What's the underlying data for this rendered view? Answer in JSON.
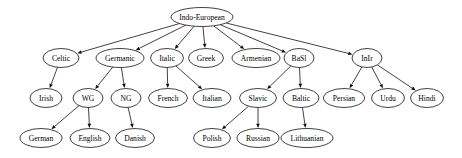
{
  "diagram": {
    "type": "directed-tree",
    "node_shape": "ellipse",
    "colors": {
      "background": "#ffffff",
      "node_fill": "#ffffff",
      "node_stroke": "#111111",
      "edge": "#111111",
      "label": "#000000"
    },
    "nodes": [
      {
        "id": "indo-european",
        "label": "Indo-European",
        "cx": 202,
        "cy": 17,
        "rx": 31,
        "ry": 9.5,
        "depth": 0
      },
      {
        "id": "celtic",
        "label": "Celtic",
        "cx": 61,
        "cy": 58,
        "rx": 18,
        "ry": 9.5,
        "depth": 1
      },
      {
        "id": "germanic",
        "label": "Germanic",
        "cx": 120,
        "cy": 58,
        "rx": 24,
        "ry": 9.5,
        "depth": 1
      },
      {
        "id": "italic",
        "label": "Italic",
        "cx": 167,
        "cy": 58,
        "rx": 16.5,
        "ry": 9.5,
        "depth": 1
      },
      {
        "id": "greek",
        "label": "Greek",
        "cx": 206,
        "cy": 58,
        "rx": 17.5,
        "ry": 9.5,
        "depth": 1
      },
      {
        "id": "armenian",
        "label": "Armenian",
        "cx": 256,
        "cy": 58,
        "rx": 24,
        "ry": 9.5,
        "depth": 1
      },
      {
        "id": "basl",
        "label": "BaSl",
        "cx": 299,
        "cy": 58,
        "rx": 15,
        "ry": 9.5,
        "depth": 1
      },
      {
        "id": "inir",
        "label": "InIr",
        "cx": 367,
        "cy": 58,
        "rx": 15,
        "ry": 9.5,
        "depth": 1
      },
      {
        "id": "irish",
        "label": "Irish",
        "cx": 46,
        "cy": 98,
        "rx": 16,
        "ry": 9.5,
        "depth": 2
      },
      {
        "id": "wg",
        "label": "WG",
        "cx": 88,
        "cy": 98,
        "rx": 15,
        "ry": 9.5,
        "depth": 2
      },
      {
        "id": "ng",
        "label": "NG",
        "cx": 126,
        "cy": 98,
        "rx": 15,
        "ry": 9.5,
        "depth": 2
      },
      {
        "id": "french",
        "label": "French",
        "cx": 168,
        "cy": 98,
        "rx": 19.5,
        "ry": 9.5,
        "depth": 2
      },
      {
        "id": "italian",
        "label": "Italian",
        "cx": 212,
        "cy": 98,
        "rx": 19,
        "ry": 9.5,
        "depth": 2
      },
      {
        "id": "slavic",
        "label": "Slavic",
        "cx": 258,
        "cy": 98,
        "rx": 18.5,
        "ry": 9.5,
        "depth": 2
      },
      {
        "id": "baltic",
        "label": "Baltic",
        "cx": 301,
        "cy": 98,
        "rx": 18,
        "ry": 9.5,
        "depth": 2
      },
      {
        "id": "persian",
        "label": "Persian",
        "cx": 344,
        "cy": 98,
        "rx": 20.5,
        "ry": 9.5,
        "depth": 2
      },
      {
        "id": "urdu",
        "label": "Urdu",
        "cx": 388,
        "cy": 98,
        "rx": 16.5,
        "ry": 9.5,
        "depth": 2
      },
      {
        "id": "hindi",
        "label": "Hindi",
        "cx": 427,
        "cy": 98,
        "rx": 16.5,
        "ry": 9.5,
        "depth": 2
      },
      {
        "id": "german",
        "label": "German",
        "cx": 41,
        "cy": 138,
        "rx": 21,
        "ry": 9.5,
        "depth": 3
      },
      {
        "id": "english",
        "label": "English",
        "cx": 90,
        "cy": 138,
        "rx": 20,
        "ry": 9.5,
        "depth": 3
      },
      {
        "id": "danish",
        "label": "Danish",
        "cx": 135,
        "cy": 138,
        "rx": 19.5,
        "ry": 9.5,
        "depth": 3
      },
      {
        "id": "polish",
        "label": "Polish",
        "cx": 212,
        "cy": 138,
        "rx": 18.5,
        "ry": 9.5,
        "depth": 3
      },
      {
        "id": "russian",
        "label": "Russian",
        "cx": 258,
        "cy": 138,
        "rx": 21,
        "ry": 9.5,
        "depth": 3
      },
      {
        "id": "lithuanian",
        "label": "Lithuanian",
        "cx": 307,
        "cy": 138,
        "rx": 26,
        "ry": 9.5,
        "depth": 3
      }
    ],
    "edges": [
      {
        "from": "indo-european",
        "to": "celtic"
      },
      {
        "from": "indo-european",
        "to": "germanic"
      },
      {
        "from": "indo-european",
        "to": "italic"
      },
      {
        "from": "indo-european",
        "to": "greek"
      },
      {
        "from": "indo-european",
        "to": "armenian"
      },
      {
        "from": "indo-european",
        "to": "basl"
      },
      {
        "from": "indo-european",
        "to": "inir"
      },
      {
        "from": "celtic",
        "to": "irish"
      },
      {
        "from": "germanic",
        "to": "wg"
      },
      {
        "from": "germanic",
        "to": "ng"
      },
      {
        "from": "italic",
        "to": "french"
      },
      {
        "from": "italic",
        "to": "italian"
      },
      {
        "from": "basl",
        "to": "slavic"
      },
      {
        "from": "basl",
        "to": "baltic"
      },
      {
        "from": "inir",
        "to": "persian"
      },
      {
        "from": "inir",
        "to": "urdu"
      },
      {
        "from": "inir",
        "to": "hindi"
      },
      {
        "from": "wg",
        "to": "german"
      },
      {
        "from": "wg",
        "to": "english"
      },
      {
        "from": "ng",
        "to": "danish"
      },
      {
        "from": "slavic",
        "to": "polish"
      },
      {
        "from": "slavic",
        "to": "russian"
      },
      {
        "from": "baltic",
        "to": "lithuanian"
      }
    ]
  }
}
